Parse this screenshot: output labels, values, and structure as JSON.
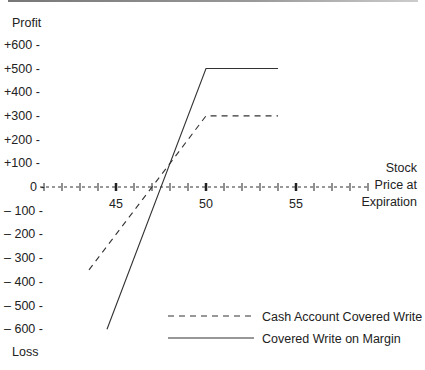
{
  "chart_data": {
    "type": "line",
    "title": "",
    "ylabel_top": "Profit",
    "ylabel_bottom": "Loss",
    "xlabel": "Stock Price at Expiration",
    "xlabel_lines": [
      "Stock",
      "Price at",
      "Expiration"
    ],
    "y_ticks": [
      "+600 -",
      "+500 -",
      "+400 -",
      "+300 -",
      "+200 -",
      "+100 -",
      "0 -",
      "– 100 -",
      "– 200 -",
      "– 300 -",
      "– 400 -",
      "– 500 -",
      "– 600 -"
    ],
    "y_tick_values": [
      600,
      500,
      400,
      300,
      200,
      100,
      0,
      -100,
      -200,
      -300,
      -400,
      -500,
      -600
    ],
    "x_ticks": [
      "45",
      "50",
      "55"
    ],
    "x_tick_values": [
      45,
      50,
      55
    ],
    "xlim": [
      41,
      59
    ],
    "ylim": [
      -600,
      600
    ],
    "grid": false,
    "legend_position": "lower right",
    "series": [
      {
        "name": "Cash Account Covered Write",
        "style": "dashed",
        "x": [
          43.5,
          50,
          54
        ],
        "y": [
          -350,
          300,
          300
        ]
      },
      {
        "name": "Covered Write on Margin",
        "style": "solid",
        "x": [
          44.5,
          50,
          54
        ],
        "y": [
          -600,
          500,
          500
        ]
      }
    ]
  }
}
